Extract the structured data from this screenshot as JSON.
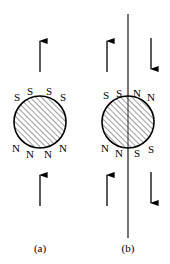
{
  "figure": {
    "type": "diagram",
    "background_color": "#ffffff",
    "stroke_color": "#000000",
    "hatch_color": "#555555",
    "panels": [
      {
        "id": "a",
        "caption": "(a)",
        "caption_x": 40,
        "caption_y": 252,
        "sphere": {
          "cx": 40,
          "cy": 122,
          "r": 26,
          "fill": "hatch",
          "hatch_angle_deg": 45
        },
        "top_labels": [
          {
            "text": "S",
            "x": 17,
            "y": 101,
            "rotate": 0
          },
          {
            "text": "S",
            "x": 30,
            "y": 95,
            "rotate": 0
          },
          {
            "text": "S",
            "x": 49,
            "y": 95,
            "rotate": 0
          },
          {
            "text": "S",
            "x": 63,
            "y": 101,
            "rotate": 0
          }
        ],
        "bottom_labels": [
          {
            "text": "N",
            "x": 16,
            "y": 152,
            "rotate": 0
          },
          {
            "text": "N",
            "x": 30,
            "y": 158,
            "rotate": 0
          },
          {
            "text": "N",
            "x": 48,
            "y": 158,
            "rotate": 0
          },
          {
            "text": "N",
            "x": 63,
            "y": 152,
            "rotate": 0
          }
        ],
        "arrows": [
          {
            "name": "field-arrow-top",
            "x": 40,
            "y1": 72,
            "y2": 38,
            "direction": "up"
          },
          {
            "name": "field-arrow-bottom",
            "x": 40,
            "y1": 206,
            "y2": 172,
            "direction": "up"
          }
        ],
        "axis_line": null
      },
      {
        "id": "b",
        "caption": "(b)",
        "caption_x": 128,
        "caption_y": 252,
        "sphere": {
          "cx": 128,
          "cy": 122,
          "r": 26,
          "fill": "hatch",
          "hatch_angle_deg": 45
        },
        "top_labels": [
          {
            "text": "S",
            "x": 106,
            "y": 99,
            "rotate": 0
          },
          {
            "text": "S",
            "x": 119,
            "y": 97,
            "rotate": 0
          },
          {
            "text": "N",
            "x": 136,
            "y": 97,
            "rotate": 0
          },
          {
            "text": "N",
            "x": 150,
            "y": 101,
            "rotate": 0
          }
        ],
        "bottom_labels": [
          {
            "text": "N",
            "x": 105,
            "y": 152,
            "rotate": 0
          },
          {
            "text": "N",
            "x": 119,
            "y": 157,
            "rotate": 0
          },
          {
            "text": "S",
            "x": 136,
            "y": 157,
            "rotate": 0
          },
          {
            "text": "S",
            "x": 150,
            "y": 153,
            "rotate": 0
          }
        ],
        "arrows": [
          {
            "name": "field-arrow-top-left",
            "x": 107,
            "y1": 72,
            "y2": 38,
            "direction": "up"
          },
          {
            "name": "field-arrow-top-right",
            "x": 151,
            "y1": 38,
            "y2": 72,
            "direction": "down"
          },
          {
            "name": "field-arrow-bottom-left",
            "x": 107,
            "y1": 206,
            "y2": 172,
            "direction": "up"
          },
          {
            "name": "field-arrow-bottom-right",
            "x": 151,
            "y1": 172,
            "y2": 206,
            "direction": "down"
          }
        ],
        "axis_line": {
          "x": 128,
          "y1": 14,
          "y2": 238
        }
      }
    ]
  }
}
